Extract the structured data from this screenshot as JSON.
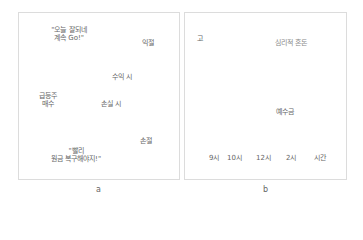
{
  "panel_a": {
    "caption": "a",
    "nodes": {
      "buy": {
        "line1": "급등주",
        "line2": "매수"
      },
      "profit": {
        "label": "익절"
      },
      "loss": {
        "label": "손절"
      }
    },
    "edges": {
      "to_profit": "수익 시",
      "to_loss": "손실 시"
    },
    "quotes": {
      "profit_back_line1": "\"오늘 잘되네",
      "profit_back_line2": "계속 Go!\"",
      "loss_back_line1": "\"빨리",
      "loss_back_line2": "원금 복구해야지!\""
    }
  },
  "panel_b": {
    "caption": "b",
    "y_axis_label": "고",
    "curves": {
      "rising": "심리적 혼돈",
      "falling": "예수금"
    },
    "x_ticks": [
      "9시",
      "10시",
      "12시",
      "2시",
      "시간"
    ]
  },
  "colors": {
    "dark_line": "#333333",
    "gray_line": "#777777",
    "border": "#dcdcdc"
  }
}
